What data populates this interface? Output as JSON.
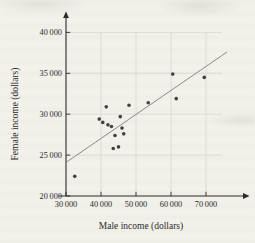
{
  "chart_data": {
    "type": "scatter",
    "title": "",
    "xlabel": "Male income (dollars)",
    "ylabel": "Female income (dollars)",
    "x_ticks": [
      30000,
      40000,
      50000,
      60000,
      70000
    ],
    "y_ticks": [
      20000,
      25000,
      30000,
      35000,
      40000
    ],
    "xlim": [
      30000,
      76000
    ],
    "ylim": [
      20000,
      42500
    ],
    "grid": true,
    "legend": "none",
    "points": [
      [
        32500,
        22400
      ],
      [
        39500,
        29400
      ],
      [
        40500,
        29000
      ],
      [
        41500,
        30900
      ],
      [
        42000,
        28700
      ],
      [
        43000,
        28500
      ],
      [
        43500,
        25800
      ],
      [
        44000,
        27400
      ],
      [
        45000,
        26000
      ],
      [
        45500,
        29700
      ],
      [
        46000,
        28300
      ],
      [
        46500,
        27600
      ],
      [
        48000,
        31100
      ],
      [
        53500,
        31400
      ],
      [
        60500,
        34900
      ],
      [
        61500,
        31900
      ],
      [
        69500,
        34500
      ]
    ],
    "trend_line": {
      "x1": 30000,
      "y1": 24100,
      "x2": 76000,
      "y2": 37600
    },
    "colors": {
      "point": "#414141",
      "trend": "#8a8a8a",
      "axis": "#2a2a2a",
      "grid": "#d8d8d2",
      "text": "#2b2b2b",
      "page_background": "#f2f1ea"
    }
  }
}
